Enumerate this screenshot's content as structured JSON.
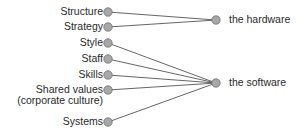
{
  "diagram": {
    "left_nodes": [
      {
        "id": "structure",
        "label": "Structure",
        "x": 108,
        "y": 12,
        "target": "hardware"
      },
      {
        "id": "strategy",
        "label": "Strategy",
        "x": 108,
        "y": 27,
        "target": "hardware"
      },
      {
        "id": "style",
        "label": "Style",
        "x": 108,
        "y": 43,
        "target": "software"
      },
      {
        "id": "staff",
        "label": "Staff",
        "x": 108,
        "y": 59,
        "target": "software"
      },
      {
        "id": "skills",
        "label": "Skills",
        "x": 108,
        "y": 75,
        "target": "software"
      },
      {
        "id": "shared_values",
        "label": "Shared values",
        "label2": "(corporate culture)",
        "x": 108,
        "y": 90,
        "target": "software"
      },
      {
        "id": "systems",
        "label": "Systems",
        "x": 108,
        "y": 122,
        "target": "software"
      }
    ],
    "right_nodes": [
      {
        "id": "hardware",
        "label": "the hardware",
        "x": 216,
        "y": 20
      },
      {
        "id": "software",
        "label": "the software",
        "x": 216,
        "y": 83
      }
    ],
    "colors": {
      "node_fill": "#a8a8a8",
      "node_stroke": "#707070",
      "line": "#555555",
      "text": "#2a2a2a"
    }
  }
}
